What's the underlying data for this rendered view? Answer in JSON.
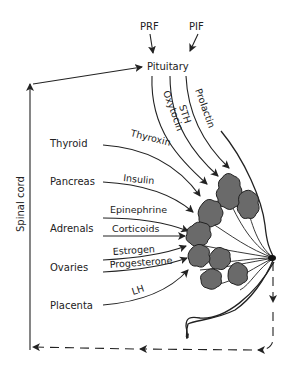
{
  "diagram": {
    "type": "hormonal control of mammary gland",
    "top_factors": [
      "PRF",
      "PIF"
    ],
    "center_gland": "Pituitary",
    "pituitary_hormones": [
      "Oxytocin",
      "STH",
      "Prolactin"
    ],
    "glands": [
      {
        "name": "Thyroid",
        "hormones": [
          "Thyroxin"
        ]
      },
      {
        "name": "Pancreas",
        "hormones": [
          "Insulin"
        ]
      },
      {
        "name": "Adrenals",
        "hormones": [
          "Epinephrine",
          "Corticoids"
        ]
      },
      {
        "name": "Ovaries",
        "hormones": [
          "Estrogen",
          "Progesterone"
        ]
      },
      {
        "name": "Placenta",
        "hormones": [
          "LH"
        ]
      }
    ],
    "side_label": "Spinal cord",
    "target": "Mammary gland (breast with alveolar lobes)",
    "feedback": "Dashed nerve pathway from nipple back to spinal cord"
  },
  "labels": {
    "prf": "PRF",
    "pif": "PIF",
    "pituitary": "Pituitary",
    "oxytocin": "Oxytocin",
    "sth": "STH",
    "prolactin": "Prolactin",
    "thyroid": "Thyroid",
    "thyroxin": "Thyroxin",
    "pancreas": "Pancreas",
    "insulin": "Insulin",
    "adrenals": "Adrenals",
    "epinephrine": "Epinephrine",
    "corticoids": "Corticoids",
    "ovaries": "Ovaries",
    "estrogen": "Estrogen",
    "progesterone": "Progesterone",
    "placenta": "Placenta",
    "lh": "LH",
    "spinal_cord": "Spinal cord"
  }
}
